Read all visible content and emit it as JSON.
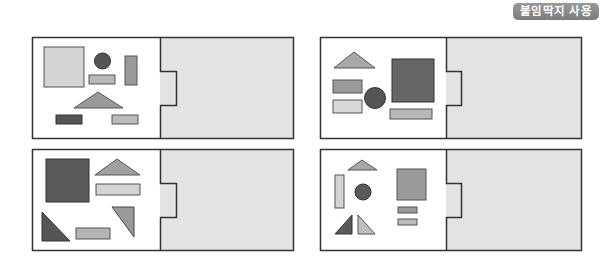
{
  "badge": {
    "label": "붙임딱지 사용",
    "color": "#8a8a8a"
  },
  "colors": {
    "border": "#333333",
    "panel_fill": "#e3e3e3",
    "light": "#d4d4d4",
    "medium": "#9a9a9a",
    "dark": "#555555"
  },
  "cards": [
    {
      "id": "card-1",
      "position": "top-left"
    },
    {
      "id": "card-2",
      "position": "top-right"
    },
    {
      "id": "card-3",
      "position": "bottom-left"
    },
    {
      "id": "card-4",
      "position": "bottom-right"
    }
  ]
}
